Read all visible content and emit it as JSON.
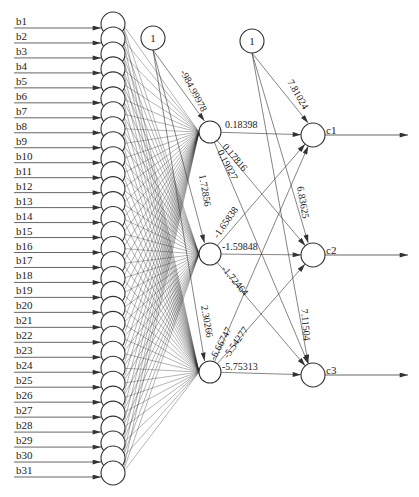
{
  "diagram": {
    "title": "",
    "input_nodes": [
      "b1",
      "b2",
      "b3",
      "b4",
      "b5",
      "b6",
      "b7",
      "b8",
      "b9",
      "b10",
      "b11",
      "b12",
      "b13",
      "b14",
      "b15",
      "b16",
      "b17",
      "b18",
      "b19",
      "b20",
      "b21",
      "b22",
      "b23",
      "b24",
      "b25",
      "b26",
      "b27",
      "b28",
      "b29",
      "b30",
      "b31"
    ],
    "bias_nodes": [
      {
        "id": "bias-hidden",
        "label": "1"
      },
      {
        "id": "bias-output",
        "label": "1"
      }
    ],
    "hidden_nodes": [
      {
        "id": "h1",
        "label": ""
      },
      {
        "id": "h2",
        "label": ""
      },
      {
        "id": "h3",
        "label": ""
      }
    ],
    "output_nodes": [
      {
        "id": "c1",
        "label": "c1"
      },
      {
        "id": "c2",
        "label": "c2"
      },
      {
        "id": "c3",
        "label": "c3"
      }
    ],
    "weights": {
      "bias_hidden_to_h1": "-984.99978",
      "bias_hidden_to_h2": "1.72856",
      "bias_hidden_to_h3": "2.30266",
      "bias_output_to_c1": "7.81024",
      "bias_output_to_c2": "6.83625",
      "bias_output_to_c3": "7.11504",
      "h1_to_c1": "0.18398",
      "h1_to_c2": "0.17816",
      "h1_to_c3": "0.19027",
      "h2_to_c1": "-1.65838",
      "h2_to_c2": "-1.59848",
      "h2_to_c3": "-1.72464",
      "h3_to_c1": "-6.66747",
      "h3_to_c2": "-5.54277",
      "h3_to_c3": "-5.75313"
    },
    "input_weight_labels_note": "dense overlapping weight labels between inputs and hidden layer (illegible)"
  }
}
